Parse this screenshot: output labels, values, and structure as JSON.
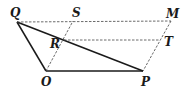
{
  "diagram": {
    "type": "geometry",
    "points": {
      "Q": {
        "label": "Q",
        "x": 17,
        "y": 22,
        "lx": 10,
        "ly": 17
      },
      "S": {
        "label": "S",
        "x": 73,
        "y": 21,
        "lx": 72,
        "ly": 17
      },
      "M": {
        "label": "M",
        "x": 171,
        "y": 21,
        "lx": 166,
        "ly": 18
      },
      "R": {
        "label": "R",
        "x": 64,
        "y": 40,
        "lx": 50,
        "ly": 48
      },
      "T": {
        "label": "T",
        "x": 159,
        "y": 40,
        "lx": 164,
        "ly": 46
      },
      "O": {
        "label": "O",
        "x": 46,
        "y": 71,
        "lx": 41,
        "ly": 86
      },
      "P": {
        "label": "P",
        "x": 143,
        "y": 71,
        "lx": 141,
        "ly": 86
      }
    },
    "solid_segments": [
      [
        "Q",
        "O"
      ],
      [
        "O",
        "P"
      ],
      [
        "Q",
        "P"
      ]
    ],
    "dashed_segments": [
      [
        "Q",
        "M"
      ],
      [
        "M",
        "P"
      ],
      [
        "O",
        "S"
      ],
      [
        "R",
        "T"
      ]
    ],
    "colors": {
      "line": "#1a1a1a",
      "dashed": "#444444"
    }
  }
}
